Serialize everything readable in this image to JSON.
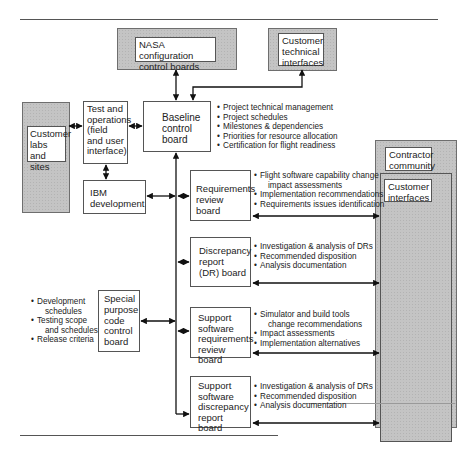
{
  "diagram": {
    "boxes": {
      "nasa_ccb": "NASA configuration control boards",
      "customer_technical": "Customer technical interfaces",
      "customer_labs": "Customer labs and sites",
      "test_operations": "Test and operations (field and user interface)",
      "baseline_board": "Baseline control board",
      "ibm_development": "IBM development",
      "requirements_board": "Requirements review board",
      "dr_board": "Discrepancy report (DR) board",
      "special_purpose": "Special purpose code control board",
      "ss_requirements": "Support software requirements review board",
      "ss_discrepancy": "Support software discrepancy report board",
      "contractor_community": "Contractor community",
      "customer_interfaces": "Customer interfaces"
    },
    "baseline_bullets": [
      "Project technical management",
      "Project schedules",
      "Milestones & dependencies",
      "Priorities for resource allocation",
      "Certification for flight readiness"
    ],
    "requirements_bullets": [
      {
        "text": "Flight software capability change",
        "cont": "impact assessments"
      },
      {
        "text": "Implementation recommendations"
      },
      {
        "text": "Requirements issues identification"
      }
    ],
    "dr_bullets": [
      "Investigation & analysis of DRs",
      "Recommended disposition",
      "Analysis documentation"
    ],
    "special_bullets": [
      {
        "text": "Development",
        "cont": "schedules"
      },
      {
        "text": "Testing scope",
        "cont": "and schedules"
      },
      {
        "text": "Release criteria"
      }
    ],
    "ss_requirements_bullets": [
      {
        "text": "Simulator and build tools",
        "cont": "change recommendations"
      },
      {
        "text": "Impact assessments"
      },
      {
        "text": "Implementation alternatives"
      }
    ],
    "ss_discrepancy_bullets": [
      "Investigation & analysis of DRs",
      "Recommended disposition",
      "Analysis documentation"
    ]
  }
}
